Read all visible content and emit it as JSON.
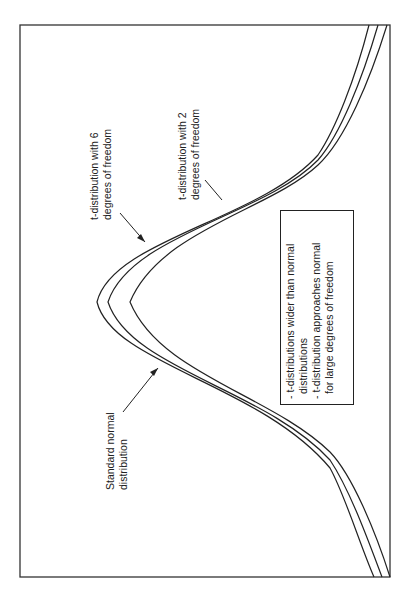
{
  "figure": {
    "orientation": "rotated-90-ccw",
    "labels": {
      "t6": [
        "t-distribution with 6",
        "degrees of freedom"
      ],
      "t2": [
        "t-distribution with 2",
        "degrees of freedom"
      ],
      "normal": [
        "Standard normal",
        "distribution"
      ]
    },
    "note_box": [
      "- t-distributions wider than normal",
      "  distributions",
      "- t-distribution approaches normal",
      "  for large degrees of freedom"
    ],
    "curves": [
      "Standard normal distribution",
      "t-distribution with 6 degrees of freedom",
      "t-distribution with 2 degrees of freedom"
    ],
    "colors": {
      "line": "#222222",
      "background": "#ffffff"
    }
  }
}
